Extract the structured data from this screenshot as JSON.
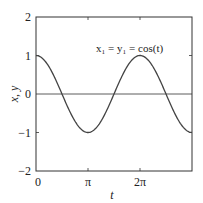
{
  "chart_data": {
    "type": "line",
    "title": "",
    "xlabel": "t",
    "ylabel": "x, y",
    "xlim": [
      0,
      9.42477
    ],
    "ylim": [
      -2,
      2
    ],
    "grid": false,
    "legend": null,
    "x_ticks": [
      {
        "value": 0,
        "label": "0"
      },
      {
        "value": 3.14159,
        "label": "π"
      },
      {
        "value": 6.28319,
        "label": "2π"
      }
    ],
    "y_ticks": [
      {
        "value": 2,
        "label": "2"
      },
      {
        "value": 1,
        "label": "1"
      },
      {
        "value": 0,
        "label": "0"
      },
      {
        "value": -1,
        "label": "−1"
      },
      {
        "value": -2,
        "label": "−2"
      }
    ],
    "annotations": [
      {
        "text": "x₁ = y₁ = cos(t)",
        "x": 4.6,
        "y": 1.3
      }
    ],
    "reference_lines": [
      {
        "y": 0
      }
    ],
    "series": [
      {
        "name": "x1 = y1 = cos(t)",
        "function": "cos(t)",
        "x": [
          0,
          0.785,
          1.571,
          2.356,
          3.142,
          3.927,
          4.712,
          5.498,
          6.283,
          7.069,
          7.854,
          8.639,
          9.425
        ],
        "values": [
          1,
          0.707,
          0,
          -0.707,
          -1,
          -0.707,
          0,
          0.707,
          1,
          0.707,
          0,
          -0.707,
          -1
        ]
      }
    ]
  },
  "labels": {
    "xlabel": "t",
    "ylabel": "x, y",
    "annotation": "x₁ = y₁ = cos(t)",
    "xt0": "0",
    "xt1": "π",
    "xt2": "2π",
    "yt2": "2",
    "yt1": "1",
    "yt0": "0",
    "ytm1": "−1",
    "ytm2": "−2"
  }
}
